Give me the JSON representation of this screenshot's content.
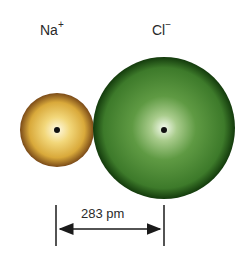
{
  "diagram": {
    "ions": [
      {
        "name": "Na",
        "charge": "+",
        "cx": 57,
        "cy": 130,
        "r": 37,
        "color_center": "#fbf3c8",
        "color_mid": "#e0b84a",
        "color_edge": "#8a5a1c"
      },
      {
        "name": "Cl",
        "charge": "−",
        "cx": 164,
        "cy": 128,
        "r": 71,
        "color_center": "#f3f8ee",
        "color_mid": "#4e8a34",
        "color_edge": "#173f10"
      }
    ],
    "distance": {
      "label": "283 pm",
      "x1": 56,
      "x2": 164,
      "y": 229
    }
  }
}
